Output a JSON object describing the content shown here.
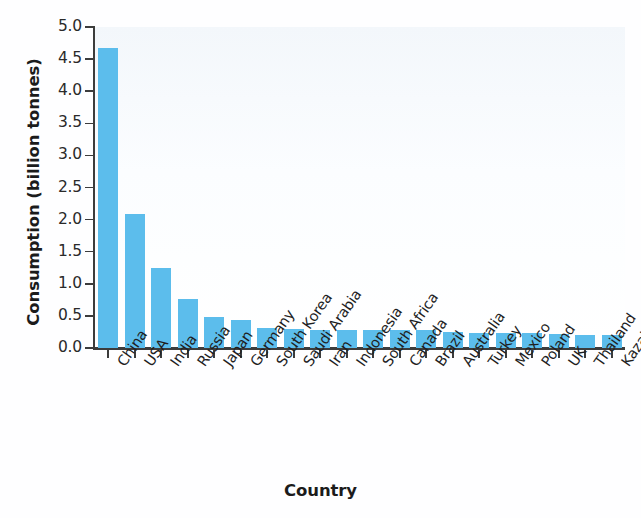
{
  "chart_data": {
    "type": "bar",
    "title": "",
    "xlabel": "Country",
    "ylabel": "Consumption (billion tonnes)",
    "categories": [
      "China",
      "USA",
      "India",
      "Russia",
      "Japan",
      "Germany",
      "South Korea",
      "Saudi Arabia",
      "Iran",
      "Indonesia",
      "South Africa",
      "Canada",
      "Brazil",
      "Australia",
      "Turkey",
      "Mexico",
      "Poland",
      "UK",
      "Thailand",
      "Kazakhstan"
    ],
    "values": [
      4.67,
      2.09,
      1.25,
      0.76,
      0.49,
      0.43,
      0.31,
      0.3,
      0.28,
      0.28,
      0.28,
      0.28,
      0.28,
      0.25,
      0.24,
      0.24,
      0.23,
      0.22,
      0.21,
      0.2
    ],
    "ylim": [
      0.0,
      5.0
    ],
    "ytick_labels": [
      "0.0",
      "0.5",
      "1.0",
      "1.5",
      "2.0",
      "2.5",
      "3.0",
      "3.5",
      "4.0",
      "4.5",
      "5.0"
    ],
    "ytick_values": [
      0.0,
      0.5,
      1.0,
      1.5,
      2.0,
      2.5,
      3.0,
      3.5,
      4.0,
      4.5,
      5.0
    ],
    "grid": false,
    "legend": false,
    "bar_color": "#5cbdec",
    "axis_color": "#3c3c3c",
    "plot_background": "#fbfdff"
  }
}
